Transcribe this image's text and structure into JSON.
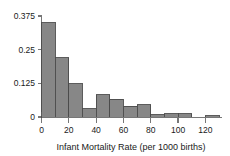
{
  "chart_data": {
    "type": "bar",
    "title": "",
    "subtitle": "",
    "xlabel": "Infant Mortality Rate (per 1000 births)",
    "ylabel": "",
    "xlim": [
      0,
      130
    ],
    "ylim": [
      0,
      0.375
    ],
    "grid": false,
    "legend": null,
    "bin_width": 10,
    "bin_starts": [
      0,
      10,
      20,
      30,
      40,
      50,
      60,
      70,
      80,
      90,
      100,
      110,
      120
    ],
    "bin_ends": [
      10,
      20,
      30,
      40,
      50,
      60,
      70,
      80,
      90,
      100,
      110,
      120,
      130
    ],
    "categories": [
      "0-10",
      "10-20",
      "20-30",
      "30-40",
      "40-50",
      "50-60",
      "60-70",
      "70-80",
      "80-90",
      "90-100",
      "100-110",
      "110-120",
      "120-130"
    ],
    "values": [
      0.35,
      0.22,
      0.123,
      0.03,
      0.083,
      0.065,
      0.04,
      0.045,
      0.008,
      0.012,
      0.012,
      0.0,
      0.004
    ],
    "xticks": [
      0,
      20,
      40,
      60,
      80,
      100,
      120
    ],
    "xticklabels": [
      "0",
      "20",
      "40",
      "60",
      "80",
      "100",
      "120"
    ],
    "yticks": [
      0,
      0.125,
      0.25,
      0.375
    ],
    "yticklabels": [
      "0",
      "0.125",
      "0.25",
      "0.375"
    ],
    "bar_fill_color": "#878787",
    "bar_edge_color": "#4a4a4a",
    "axis_color": "#555555",
    "text_color": "#1a1a1a"
  }
}
